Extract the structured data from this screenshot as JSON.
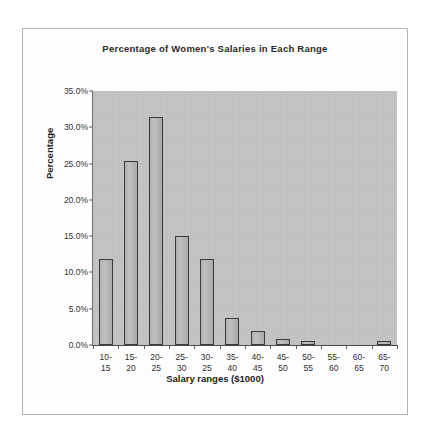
{
  "chart_data": {
    "type": "bar",
    "title": "Percentage of Women's Salaries in Each Range",
    "xlabel": "Salary ranges ($1000)",
    "ylabel": "Percentage",
    "categories": [
      "10-15",
      "15-20",
      "20-25",
      "25-30",
      "30-25",
      "35-40",
      "40-45",
      "45-50",
      "50-55",
      "55-60",
      "60-65",
      "65-70"
    ],
    "category_lines": [
      [
        "10-",
        "15"
      ],
      [
        "15-",
        "20"
      ],
      [
        "20-",
        "25"
      ],
      [
        "25-",
        "30"
      ],
      [
        "30-",
        "25"
      ],
      [
        "35-",
        "40"
      ],
      [
        "40-",
        "45"
      ],
      [
        "45-",
        "50"
      ],
      [
        "50-",
        "55"
      ],
      [
        "55-",
        "60"
      ],
      [
        "60-",
        "65"
      ],
      [
        "65-",
        "70"
      ]
    ],
    "values": [
      11.9,
      25.4,
      31.4,
      15.0,
      11.8,
      3.7,
      2.0,
      0.8,
      0.6,
      0.0,
      0.0,
      0.5
    ],
    "ylim": [
      0,
      35
    ],
    "ytick_values": [
      0,
      5,
      10,
      15,
      20,
      25,
      30,
      35
    ],
    "ytick_labels": [
      "0.0%",
      "5.0%",
      "10.0%",
      "15.0%",
      "20.0%",
      "25.0%",
      "30.0%",
      "35.0%"
    ],
    "grid": false,
    "legend": "none",
    "plot_background_color": "#c6c6c6",
    "bar_fill_color": "#b8b8b8",
    "bar_border_color": "#3a3a3a",
    "axis_color": "#5a5a5a",
    "page_background_color": "#ffffff"
  }
}
